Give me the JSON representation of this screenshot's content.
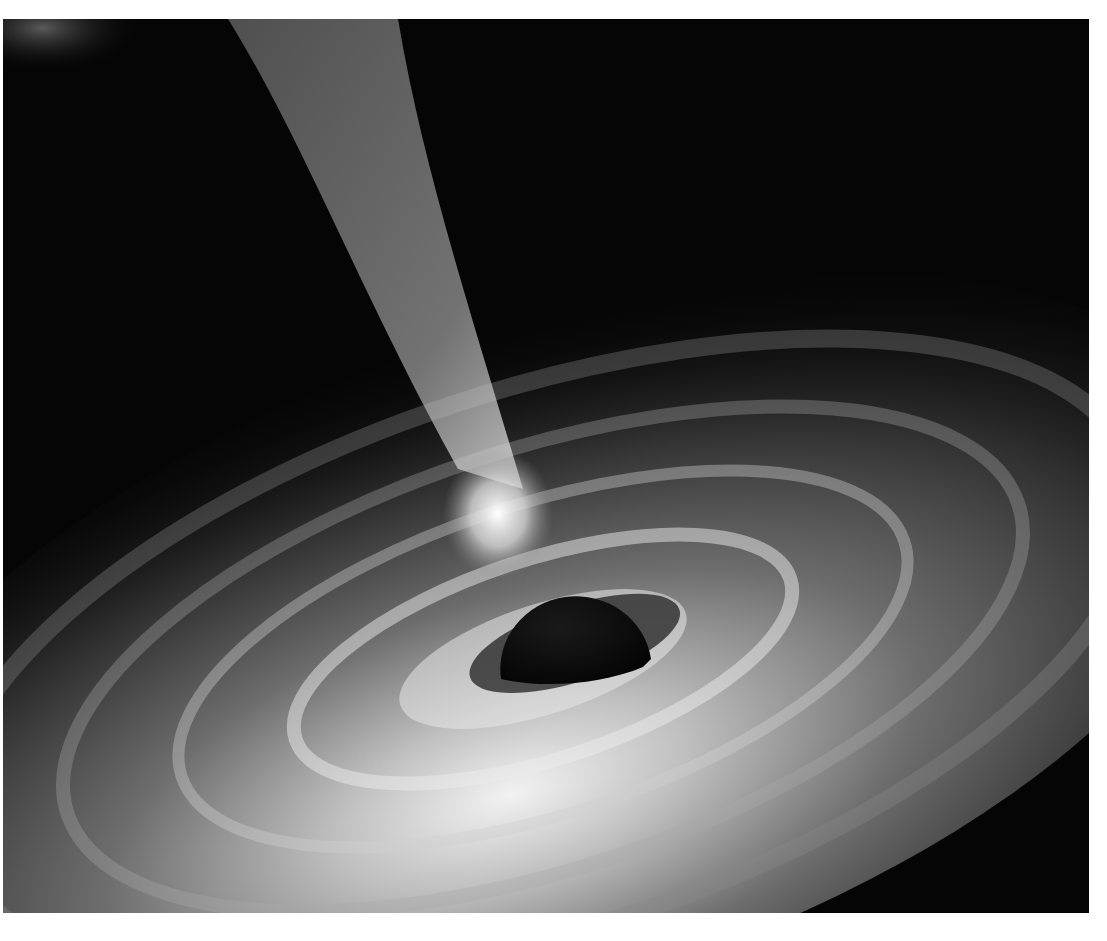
{
  "image": {
    "subject": "black hole with accretion disk and relativistic jet",
    "palette": "grayscale",
    "colors": {
      "background": "#050505",
      "disk_bright": "#e8e8e8",
      "disk_mid": "#7a7a7a",
      "jet": "#bdbdbd",
      "black_hole": "#0a0a0a",
      "border": "#ffffff"
    }
  }
}
